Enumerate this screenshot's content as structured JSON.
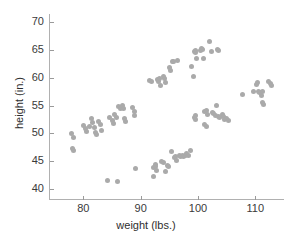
{
  "chart_data": {
    "type": "scatter",
    "title": "",
    "xlabel": "weight (lbs.)",
    "ylabel": "height (in.)",
    "xlim": [
      74,
      115
    ],
    "ylim": [
      38,
      71.5
    ],
    "xticks": [
      80,
      90,
      100,
      110
    ],
    "yticks": [
      40,
      45,
      50,
      55,
      60,
      65,
      70
    ],
    "xticklabels": [
      "80",
      "90",
      "100",
      "110"
    ],
    "yticklabels": [
      "40",
      "45",
      "50",
      "55",
      "60",
      "65",
      "70"
    ],
    "grid": false,
    "legend": null,
    "marker": {
      "shape": "circle",
      "color": "#aaaaaa",
      "size": 5
    },
    "series": [
      {
        "name": "height vs weight",
        "color": "#aaaaaa",
        "points": [
          [
            77.9,
            49.9
          ],
          [
            78.2,
            49.2
          ],
          [
            78.1,
            47.3
          ],
          [
            78.3,
            46.9
          ],
          [
            80.0,
            51.5
          ],
          [
            80.3,
            50.9
          ],
          [
            80.6,
            50.3
          ],
          [
            81.0,
            51.3
          ],
          [
            81.4,
            52.6
          ],
          [
            81.6,
            51.9
          ],
          [
            81.9,
            51.1
          ],
          [
            82.1,
            50.2
          ],
          [
            82.3,
            49.8
          ],
          [
            82.6,
            52.1
          ],
          [
            82.9,
            51.6
          ],
          [
            83.2,
            50.6
          ],
          [
            84.2,
            41.6
          ],
          [
            84.6,
            52.9
          ],
          [
            85.0,
            52.3
          ],
          [
            85.2,
            51.7
          ],
          [
            85.5,
            53.4
          ],
          [
            85.7,
            52.9
          ],
          [
            86.0,
            41.4
          ],
          [
            86.2,
            54.8
          ],
          [
            86.4,
            54.5
          ],
          [
            86.6,
            54.6
          ],
          [
            86.8,
            55.0
          ],
          [
            87.0,
            54.5
          ],
          [
            87.2,
            52.6
          ],
          [
            87.4,
            52.2
          ],
          [
            88.6,
            54.6
          ],
          [
            88.9,
            53.9
          ],
          [
            89.0,
            53.2
          ],
          [
            89.1,
            43.6
          ],
          [
            91.6,
            59.6
          ],
          [
            91.9,
            59.4
          ],
          [
            92.2,
            42.3
          ],
          [
            92.3,
            43.9
          ],
          [
            92.5,
            44.4
          ],
          [
            92.6,
            44.0
          ],
          [
            92.7,
            43.3
          ],
          [
            92.9,
            59.7
          ],
          [
            93.1,
            59.3
          ],
          [
            93.3,
            59.8
          ],
          [
            93.5,
            58.6
          ],
          [
            93.7,
            45.0
          ],
          [
            93.9,
            44.7
          ],
          [
            94.0,
            60.2
          ],
          [
            94.2,
            59.8
          ],
          [
            94.3,
            59.2
          ],
          [
            94.4,
            43.2
          ],
          [
            94.6,
            44.3
          ],
          [
            94.8,
            44.1
          ],
          [
            95.0,
            61.9
          ],
          [
            95.2,
            61.3
          ],
          [
            95.3,
            46.8
          ],
          [
            95.5,
            63.0
          ],
          [
            95.7,
            62.9
          ],
          [
            95.9,
            45.6
          ],
          [
            96.1,
            45.8
          ],
          [
            96.3,
            45.2
          ],
          [
            96.5,
            63.2
          ],
          [
            96.8,
            46.0
          ],
          [
            97.0,
            45.9
          ],
          [
            97.3,
            46.1
          ],
          [
            97.5,
            45.8
          ],
          [
            97.8,
            46.0
          ],
          [
            98.0,
            46.4
          ],
          [
            98.3,
            46.0
          ],
          [
            98.6,
            46.9
          ],
          [
            98.9,
            62.1
          ],
          [
            99.2,
            60.2
          ],
          [
            99.4,
            64.8
          ],
          [
            99.5,
            65.0
          ],
          [
            99.6,
            64.6
          ],
          [
            99.7,
            63.4
          ],
          [
            99.3,
            52.9
          ],
          [
            99.5,
            53.3
          ],
          [
            99.6,
            52.5
          ],
          [
            100.4,
            64.9
          ],
          [
            100.6,
            65.2
          ],
          [
            100.8,
            65.1
          ],
          [
            100.9,
            63.5
          ],
          [
            101.2,
            53.9
          ],
          [
            101.4,
            54.2
          ],
          [
            101.6,
            53.4
          ],
          [
            101.1,
            51.6
          ],
          [
            101.4,
            51.3
          ],
          [
            102.0,
            66.6
          ],
          [
            102.3,
            64.7
          ],
          [
            102.5,
            53.8
          ],
          [
            102.7,
            53.6
          ],
          [
            103.0,
            53.2
          ],
          [
            103.2,
            55.0
          ],
          [
            103.4,
            65.1
          ],
          [
            103.6,
            64.9
          ],
          [
            103.5,
            53.0
          ],
          [
            103.8,
            52.8
          ],
          [
            104.2,
            53.4
          ],
          [
            104.4,
            53.0
          ],
          [
            104.6,
            52.5
          ],
          [
            105.0,
            52.6
          ],
          [
            105.3,
            52.3
          ],
          [
            107.7,
            57.0
          ],
          [
            109.7,
            57.6
          ],
          [
            110.2,
            58.8
          ],
          [
            110.4,
            59.2
          ],
          [
            110.6,
            57.6
          ],
          [
            110.8,
            57.3
          ],
          [
            111.0,
            56.8
          ],
          [
            111.2,
            57.5
          ],
          [
            111.3,
            55.5
          ],
          [
            111.5,
            55.2
          ],
          [
            112.3,
            59.4
          ],
          [
            112.6,
            59.0
          ],
          [
            112.8,
            58.6
          ]
        ]
      }
    ]
  }
}
